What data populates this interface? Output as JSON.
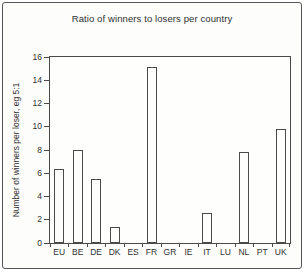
{
  "page": {
    "border_color": "#565656",
    "background_color": "#fdfdfb",
    "line_color": "#4a4a4a"
  },
  "chart_data": {
    "type": "bar",
    "title": "Ratio of winners to losers per country",
    "xlabel": "",
    "ylabel": "Number of winners per loser, eg 5:1",
    "categories": [
      "EU",
      "BE",
      "DE",
      "DK",
      "ES",
      "FR",
      "GR",
      "IE",
      "IT",
      "LU",
      "NL",
      "PT",
      "UK"
    ],
    "values": [
      6.4,
      8.0,
      5.5,
      1.4,
      0,
      15.1,
      0,
      0,
      2.6,
      0,
      7.8,
      0,
      9.8
    ],
    "ylim": [
      0,
      16
    ],
    "yticks": [
      0,
      2,
      4,
      6,
      8,
      10,
      12,
      14,
      16
    ],
    "grid": false,
    "legend": "none",
    "bar_fill": "#fefefd",
    "bar_stroke": "#4a4a4a"
  }
}
